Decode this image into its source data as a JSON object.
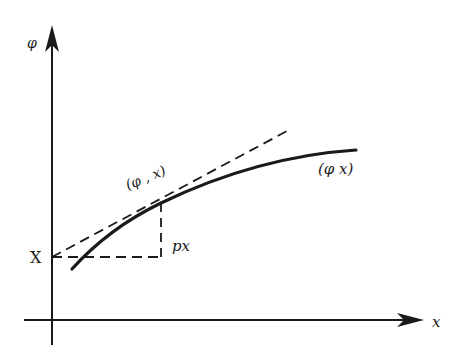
{
  "diagram": {
    "axes": {
      "y_label": "φ",
      "x_label": "x"
    },
    "labels": {
      "intercept": "X",
      "rise": "px",
      "tangent_point": "(φ , x)",
      "curve": "(φ x)"
    },
    "colors": {
      "ink": "#1a1a1a",
      "background": "#ffffff"
    }
  }
}
